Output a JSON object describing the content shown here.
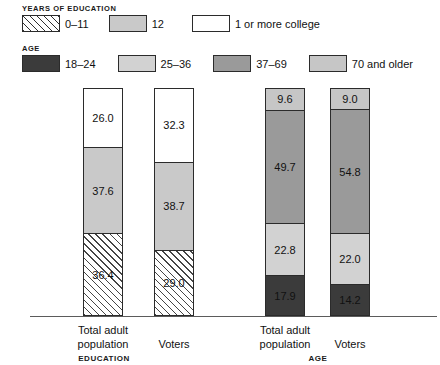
{
  "legend": {
    "education": {
      "title": "YEARS OF EDUCATION",
      "items": [
        {
          "label": "0–11",
          "swatch": "hatch-swatch",
          "color": "#ffffff"
        },
        {
          "label": "12",
          "swatch": "gray-swatch",
          "color": "#c9c9c9"
        },
        {
          "label": "1 or more college",
          "swatch": "white-swatch",
          "color": "#ffffff"
        }
      ]
    },
    "age": {
      "title": "AGE",
      "items": [
        {
          "label": "18–24",
          "swatch": "dark-swatch",
          "color": "#3b3b3b"
        },
        {
          "label": "25–36",
          "swatch": "light-gray-swatch",
          "color": "#d2d2d2"
        },
        {
          "label": "37–69",
          "swatch": "medium-gray-swatch",
          "color": "#9a9a9a"
        },
        {
          "label": "70 and older",
          "swatch": "light-gray-swatch",
          "color": "#c6c6c6"
        }
      ]
    }
  },
  "axis": {
    "education_group_label": "EDUCATION",
    "age_group_label": "AGE",
    "tick_labels": [
      "Total adult\npopulation",
      "Voters",
      "Total adult\npopulation",
      "Voters"
    ]
  },
  "bars": [
    {
      "name": "education-total-adult-population",
      "tick": "Total adult population",
      "segments": [
        {
          "series": "1 or more college",
          "value": "26.0",
          "pct": 26.0,
          "fill": "white"
        },
        {
          "series": "12",
          "value": "37.6",
          "pct": 37.6,
          "fill": "gray12"
        },
        {
          "series": "0–11",
          "value": "36.4",
          "pct": 36.4,
          "fill": "hatch"
        }
      ]
    },
    {
      "name": "education-voters",
      "tick": "Voters",
      "segments": [
        {
          "series": "1 or more college",
          "value": "32.3",
          "pct": 32.3,
          "fill": "white"
        },
        {
          "series": "12",
          "value": "38.7",
          "pct": 38.7,
          "fill": "gray12"
        },
        {
          "series": "0–11",
          "value": "29.0",
          "pct": 29.0,
          "fill": "hatch"
        }
      ]
    },
    {
      "name": "age-total-adult-population",
      "tick": "Total adult population",
      "segments": [
        {
          "series": "70 and older",
          "value": "9.6",
          "pct": 9.6,
          "fill": "age4"
        },
        {
          "series": "37–69",
          "value": "49.7",
          "pct": 49.7,
          "fill": "age3"
        },
        {
          "series": "25–36",
          "value": "22.8",
          "pct": 22.8,
          "fill": "age2"
        },
        {
          "series": "18–24",
          "value": "17.9",
          "pct": 17.9,
          "fill": "age1"
        }
      ]
    },
    {
      "name": "age-voters",
      "tick": "Voters",
      "segments": [
        {
          "series": "70 and older",
          "value": "9.0",
          "pct": 9.0,
          "fill": "age4"
        },
        {
          "series": "37–69",
          "value": "54.8",
          "pct": 54.8,
          "fill": "age3"
        },
        {
          "series": "25–36",
          "value": "22.0",
          "pct": 22.0,
          "fill": "age2"
        },
        {
          "series": "18–24",
          "value": "14.2",
          "pct": 14.2,
          "fill": "age1"
        }
      ]
    }
  ],
  "chart_data": {
    "type": "bar",
    "title": "",
    "subtitle": "",
    "stacked": true,
    "orientation": "vertical",
    "xlabel": "",
    "ylabel": "",
    "ylim": [
      0,
      100
    ],
    "grid": false,
    "legend_position": "top",
    "panels": [
      {
        "name": "EDUCATION",
        "legend_title": "YEARS OF EDUCATION",
        "categories": [
          "Total adult population",
          "Voters"
        ],
        "series": [
          {
            "name": "0–11",
            "values": [
              36.4,
              29.0
            ],
            "fill": "diagonal-hatch"
          },
          {
            "name": "12",
            "values": [
              37.6,
              38.7
            ],
            "fill": "#c9c9c9"
          },
          {
            "name": "1 or more college",
            "values": [
              26.0,
              32.3
            ],
            "fill": "#ffffff"
          }
        ]
      },
      {
        "name": "AGE",
        "legend_title": "AGE",
        "categories": [
          "Total adult population",
          "Voters"
        ],
        "series": [
          {
            "name": "18–24",
            "values": [
              17.9,
              14.2
            ],
            "fill": "#3b3b3b"
          },
          {
            "name": "25–36",
            "values": [
              22.8,
              22.0
            ],
            "fill": "#d2d2d2"
          },
          {
            "name": "37–69",
            "values": [
              49.7,
              54.8
            ],
            "fill": "#9a9a9a"
          },
          {
            "name": "70 and older",
            "values": [
              9.6,
              9.0
            ],
            "fill": "#c6c6c6"
          }
        ]
      }
    ]
  }
}
